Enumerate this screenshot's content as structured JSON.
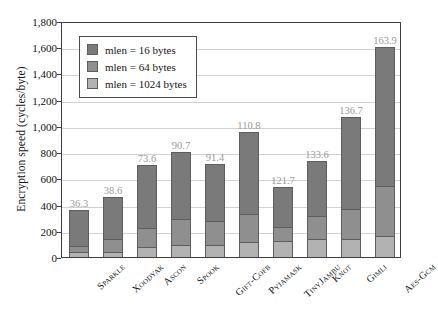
{
  "chart_data": {
    "type": "bar",
    "stacked": true,
    "title": "",
    "xlabel": "",
    "ylabel": "Encryption speed (cycles/byte)",
    "ylim": [
      0,
      1800
    ],
    "yticks": [
      "0",
      "200",
      "400",
      "600",
      "800",
      "1,000",
      "1,200",
      "1,400",
      "1,600",
      "1,800"
    ],
    "ytick_values": [
      0,
      200,
      400,
      600,
      800,
      1000,
      1200,
      1400,
      1600,
      1800
    ],
    "grid": true,
    "legend_position": "upper-left-inside",
    "categories": [
      "Sparkle",
      "Xoodyak",
      "Ascon",
      "Spook",
      "Gift-Cofb",
      "Pyjamask",
      "TinyJambu",
      "Knot",
      "Gimli",
      "Aes-Gcm"
    ],
    "series": [
      {
        "name": "mlen = 16 bytes",
        "label": "mlen = 16 bytes",
        "color": "#7a7a7a",
        "values": [
          270,
          320,
          480,
          510,
          440,
          620,
          300,
          420,
          700,
          1060
        ]
      },
      {
        "name": "mlen = 64 bytes",
        "label": "mlen = 64 bytes",
        "color": "#8f8f8f",
        "values": [
          50,
          100,
          150,
          200,
          180,
          220,
          110,
          180,
          230,
          380
        ]
      },
      {
        "name": "mlen = 1024 bytes",
        "label": "mlen = 1024 bytes",
        "color": "#b2b2b2",
        "values": [
          36.3,
          38.6,
          73.6,
          90.7,
          91.4,
          110.8,
          121.7,
          133.6,
          136.7,
          163.9
        ]
      }
    ],
    "bar_totals": [
      356,
      459,
      704,
      801,
      711,
      951,
      532,
      734,
      1067,
      1604
    ],
    "bar_value_labels": [
      "36.3",
      "38.6",
      "73.6",
      "90.7",
      "91.4",
      "110.8",
      "121.7",
      "133.6",
      "136.7",
      "163.9"
    ]
  },
  "legend": {
    "items": [
      {
        "label": "mlen = 16 bytes",
        "swatch": "s16"
      },
      {
        "label": "mlen = 64 bytes",
        "swatch": "s64"
      },
      {
        "label": "mlen = 1024 bytes",
        "swatch": "s1024"
      }
    ]
  }
}
